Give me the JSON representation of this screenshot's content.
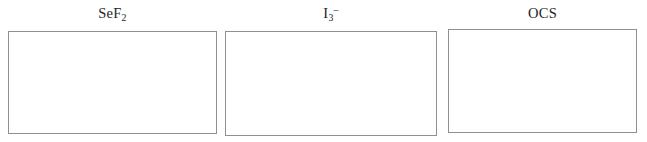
{
  "worksheet": {
    "background_color": "#ffffff",
    "text_color": "#242424",
    "box_border_color": "#8f8f8f",
    "box_fill_color": "#ffffff",
    "panels": [
      {
        "id": "sef2",
        "label_plain": "SeF2",
        "label_parts": [
          {
            "text": "SeF",
            "style": "normal"
          },
          {
            "text": "2",
            "style": "subscript"
          }
        ],
        "answer_box_content": ""
      },
      {
        "id": "i3-",
        "label_plain": "I3-",
        "label_parts": [
          {
            "text": "I",
            "style": "normal"
          },
          {
            "text": "3",
            "style": "subscript"
          },
          {
            "text": "–",
            "style": "superscript"
          }
        ],
        "answer_box_content": ""
      },
      {
        "id": "ocs",
        "label_plain": "OCS",
        "label_parts": [
          {
            "text": "OCS",
            "style": "normal"
          }
        ],
        "answer_box_content": ""
      }
    ]
  }
}
